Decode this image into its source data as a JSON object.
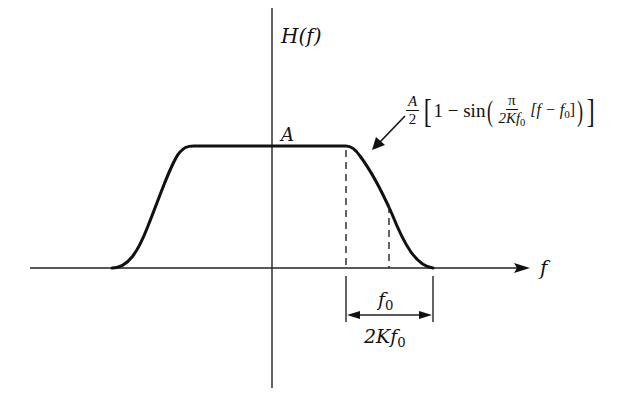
{
  "diagram": {
    "y_axis_label": "H(f)",
    "x_axis_label": "f",
    "peak_label": "A",
    "formula": {
      "coef_num": "A",
      "coef_den": "2",
      "one_minus_sin": "1 − sin",
      "pi": "π",
      "frac_den": "2Kf",
      "frac_den_sub": "0",
      "bracket_expr": "[f − f",
      "bracket_sub": "0",
      "bracket_close": "]"
    },
    "dimension_labels": {
      "f0": "f",
      "f0_sub": "0",
      "width": "2Kf",
      "width_sub": "0"
    },
    "colors": {
      "curve": "#111111",
      "axes": "#222222",
      "background": "#ffffff"
    }
  }
}
